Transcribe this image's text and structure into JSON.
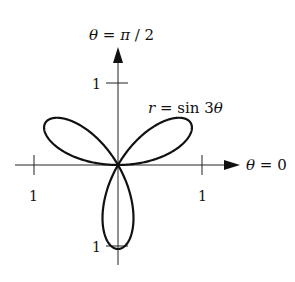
{
  "chart_data": {
    "type": "line",
    "subtype": "polar-rose",
    "equation": "r = sin 3θ",
    "curve_label": "r = sin 3θ",
    "axis_labels": {
      "polar_axis": "θ = 0",
      "vertical_axis": "θ = π / 2"
    },
    "tick_labels": {
      "right": "1",
      "left": "1",
      "top": "1",
      "bottom": "1"
    },
    "petals": 3,
    "petal_directions_deg": [
      30,
      150,
      270
    ],
    "r_max": 1,
    "color": "#111111"
  },
  "labels": {
    "theta_half_pi": "θ = π / 2",
    "theta_zero": "θ = 0",
    "curve": "r = sin 3θ",
    "tick_right": "1",
    "tick_left": "1",
    "tick_top": "1",
    "tick_bottom": "1"
  }
}
